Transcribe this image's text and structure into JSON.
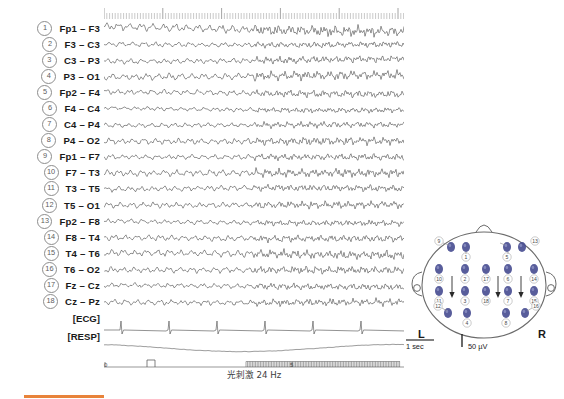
{
  "figure": {
    "type": "eeg-recording",
    "channel_count": 18,
    "aux_channels": [
      "[ECG]",
      "[RESP]"
    ]
  },
  "channels": [
    {
      "num": "1",
      "name": "Fp1 – F3"
    },
    {
      "num": "2",
      "name": "F3 – C3"
    },
    {
      "num": "3",
      "name": "C3 – P3"
    },
    {
      "num": "4",
      "name": "P3 – O1"
    },
    {
      "num": "5",
      "name": "Fp2 – F4"
    },
    {
      "num": "6",
      "name": "F4 – C4"
    },
    {
      "num": "7",
      "name": "C4 – P4"
    },
    {
      "num": "8",
      "name": "P4 – O2"
    },
    {
      "num": "9",
      "name": "Fp1 – F7"
    },
    {
      "num": "10",
      "name": "F7 – T3"
    },
    {
      "num": "11",
      "name": "T3 – T5"
    },
    {
      "num": "12",
      "name": "T5 – O1"
    },
    {
      "num": "13",
      "name": "Fp2 – F8"
    },
    {
      "num": "14",
      "name": "F8 – T4"
    },
    {
      "num": "15",
      "name": "T4 – T6"
    },
    {
      "num": "16",
      "name": "T6 – O2"
    },
    {
      "num": "17",
      "name": "Fz – Cz"
    },
    {
      "num": "18",
      "name": "Cz – Pz"
    }
  ],
  "aux": [
    {
      "name": "[ECG]"
    },
    {
      "name": "[RESP]"
    }
  ],
  "time_axis": {
    "start_label": "0",
    "mid_label": "5",
    "unit": "sec"
  },
  "stimulation": {
    "label": "光刺激 24 Hz",
    "frequency_hz": 24,
    "marker_pulse": true
  },
  "scalebar": {
    "time_label": "1 sec",
    "amplitude_label": "50 µV"
  },
  "headmap": {
    "left_label": "L",
    "right_label": "R",
    "electrode_color": "#4a4f93",
    "electrodes": [
      {
        "num": "9",
        "cx": 47,
        "cy": 33
      },
      {
        "num": "1",
        "cx": 62,
        "cy": 33
      },
      {
        "num": "5",
        "cx": 103,
        "cy": 33
      },
      {
        "num": "13",
        "cx": 118,
        "cy": 33
      },
      {
        "num": "10",
        "cx": 35,
        "cy": 55
      },
      {
        "num": "2",
        "cx": 61,
        "cy": 55
      },
      {
        "num": "17",
        "cx": 82,
        "cy": 55
      },
      {
        "num": "6",
        "cx": 104,
        "cy": 55
      },
      {
        "num": "14",
        "cx": 130,
        "cy": 55
      },
      {
        "num": "11",
        "cx": 35,
        "cy": 77
      },
      {
        "num": "3",
        "cx": 61,
        "cy": 77
      },
      {
        "num": "18",
        "cx": 82,
        "cy": 77
      },
      {
        "num": "7",
        "cx": 104,
        "cy": 77
      },
      {
        "num": "15",
        "cx": 130,
        "cy": 77
      },
      {
        "num": "12",
        "cx": 44,
        "cy": 99
      },
      {
        "num": "4",
        "cx": 63,
        "cy": 99
      },
      {
        "num": "8",
        "cx": 102,
        "cy": 99
      },
      {
        "num": "16",
        "cx": 121,
        "cy": 99
      }
    ]
  },
  "chart_data": {
    "type": "line",
    "title": "",
    "xlabel": "Time (sec)",
    "ylabel": "Channel",
    "xlim": [
      0,
      10
    ],
    "grid": false,
    "legend": "none",
    "series": [
      {
        "name": "Fp1 – F3",
        "amplitude": 5.2,
        "baseline": 8
      },
      {
        "name": "F3 – C3",
        "amplitude": 3.1,
        "baseline": 24
      },
      {
        "name": "C3 – P3",
        "amplitude": 3.4,
        "baseline": 40
      },
      {
        "name": "P3 – O1",
        "amplitude": 4.4,
        "baseline": 56
      },
      {
        "name": "Fp2 – F4",
        "amplitude": 3.6,
        "baseline": 73
      },
      {
        "name": "F4 – C4",
        "amplitude": 2.7,
        "baseline": 89
      },
      {
        "name": "C4 – P4",
        "amplitude": 2.9,
        "baseline": 105
      },
      {
        "name": "P4 – O2",
        "amplitude": 4.0,
        "baseline": 121
      },
      {
        "name": "Fp1 – F7",
        "amplitude": 3.3,
        "baseline": 137
      },
      {
        "name": "F7 – T3",
        "amplitude": 4.1,
        "baseline": 153
      },
      {
        "name": "T3 – T5",
        "amplitude": 3.5,
        "baseline": 169
      },
      {
        "name": "T5 – O1",
        "amplitude": 3.8,
        "baseline": 185
      },
      {
        "name": "Fp2 – F8",
        "amplitude": 3.0,
        "baseline": 202
      },
      {
        "name": "F8 – T4",
        "amplitude": 3.7,
        "baseline": 218
      },
      {
        "name": "T4 – T6",
        "amplitude": 4.3,
        "baseline": 234
      },
      {
        "name": "T6 – O2",
        "amplitude": 3.9,
        "baseline": 250
      },
      {
        "name": "Fz – Cz",
        "amplitude": 3.2,
        "baseline": 266
      },
      {
        "name": "Cz – Pz",
        "amplitude": 3.6,
        "baseline": 282
      }
    ],
    "aux_series": [
      {
        "name": "[ECG]",
        "type": "qrs-spikes",
        "beats": 6
      },
      {
        "name": "[RESP]",
        "type": "slow-wave",
        "cycles": 1
      }
    ]
  }
}
